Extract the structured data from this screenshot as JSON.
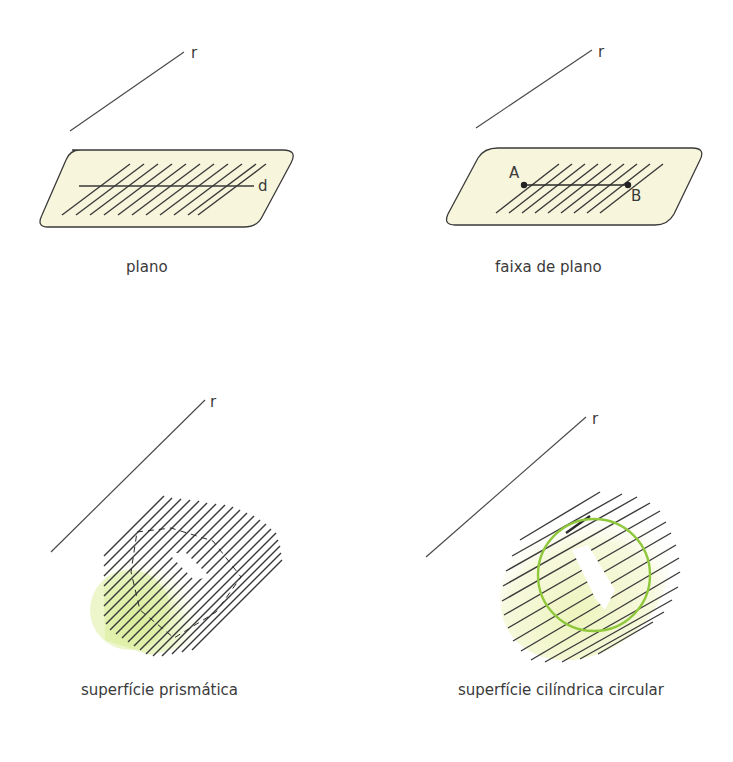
{
  "figures": [
    {
      "id": "plano",
      "caption": "plano",
      "line_label": "r",
      "inner_line_label": "d",
      "fill_color": "#f7f6dc"
    },
    {
      "id": "faixa",
      "caption": "faixa de plano",
      "line_label": "r",
      "point_a_label": "A",
      "point_b_label": "B",
      "fill_color": "#f7f6dc"
    },
    {
      "id": "prismatica",
      "caption": "superfície prismática",
      "line_label": "r",
      "fill_color": "#d9ec9a"
    },
    {
      "id": "cilindrica",
      "caption": "superfície cilíndrica circular",
      "line_label": "r",
      "fill_color": "#f3f6cf",
      "circle_color": "#8fc83c"
    }
  ],
  "colors": {
    "line": "#3a3a3a",
    "plane_fill": "#f7f6dc",
    "prism_fill": "#d9ec9a",
    "cylinder_fill": "#f3f6cf",
    "circle": "#8fc83c"
  }
}
